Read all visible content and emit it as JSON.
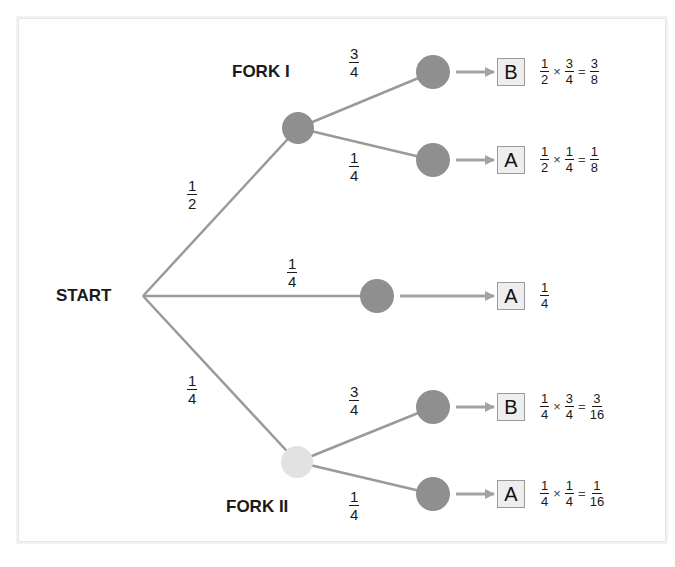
{
  "labels": {
    "start": "START",
    "fork1": "FORK I",
    "fork2": "FORK II"
  },
  "colors": {
    "branch_line": "#9a9a9a",
    "node_dark": "#8f8f8f",
    "node_light": "#e2e2e2",
    "arrow": "#a3a3a3",
    "box_fill": "#eeeeee",
    "box_border": "#9a9a9a"
  },
  "branches": {
    "start_to_fork1": {
      "num": "1",
      "den": "2"
    },
    "start_to_middle": {
      "num": "1",
      "den": "4"
    },
    "start_to_fork2": {
      "num": "1",
      "den": "4"
    },
    "fork1_upper": {
      "num": "3",
      "den": "4"
    },
    "fork1_lower": {
      "num": "1",
      "den": "4"
    },
    "fork2_upper": {
      "num": "3",
      "den": "4"
    },
    "fork2_lower": {
      "num": "1",
      "den": "4"
    }
  },
  "outcomes": [
    {
      "result": "B",
      "a": {
        "num": "1",
        "den": "2"
      },
      "op": "×",
      "b": {
        "num": "3",
        "den": "4"
      },
      "eq": "=",
      "p": {
        "num": "3",
        "den": "8"
      }
    },
    {
      "result": "A",
      "a": {
        "num": "1",
        "den": "2"
      },
      "op": "×",
      "b": {
        "num": "1",
        "den": "4"
      },
      "eq": "=",
      "p": {
        "num": "1",
        "den": "8"
      }
    },
    {
      "result": "A",
      "p": {
        "num": "1",
        "den": "4"
      }
    },
    {
      "result": "B",
      "a": {
        "num": "1",
        "den": "4"
      },
      "op": "×",
      "b": {
        "num": "3",
        "den": "4"
      },
      "eq": "=",
      "p": {
        "num": "3",
        "den": "16"
      }
    },
    {
      "result": "A",
      "a": {
        "num": "1",
        "den": "4"
      },
      "op": "×",
      "b": {
        "num": "1",
        "den": "4"
      },
      "eq": "=",
      "p": {
        "num": "1",
        "den": "16"
      }
    }
  ]
}
